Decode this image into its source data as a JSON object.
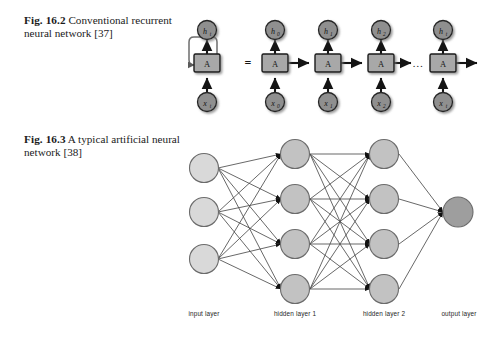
{
  "figures": [
    {
      "id": "fig-16-2",
      "caption_label": "Fig. 16.2",
      "caption_text": "Conventional recurrent neural network [37]",
      "equals_sign": "=",
      "ellipsis": "…",
      "folded_unit": {
        "cell_label": "A",
        "output_label": "h",
        "output_sub": "t",
        "input_label": "x",
        "input_sub": "t"
      },
      "unrolled_units": [
        {
          "cell_label": "A",
          "output_label": "h",
          "output_sub": "0",
          "input_label": "x",
          "input_sub": "0"
        },
        {
          "cell_label": "A",
          "output_label": "h",
          "output_sub": "1",
          "input_label": "x",
          "input_sub": "1"
        },
        {
          "cell_label": "A",
          "output_label": "h",
          "output_sub": "2",
          "input_label": "x",
          "input_sub": "2"
        },
        {
          "cell_label": "A",
          "output_label": "h",
          "output_sub": "t",
          "input_label": "x",
          "input_sub": "t"
        }
      ],
      "colors": {
        "cell_fill": "#a8a8a8",
        "cell_stroke": "#1a1a1a",
        "node_fill": "#8f8f8f",
        "node_stroke": "#262626",
        "arrow": "#141414",
        "loop_stroke": "#6e6e6e"
      }
    },
    {
      "id": "fig-16-3",
      "caption_label": "Fig. 16.3",
      "caption_text": "A typical artificial neural network [38]",
      "layers": [
        {
          "name": "input layer",
          "node_count": 3,
          "fill": "#d9d9d9"
        },
        {
          "name": "hidden layer 1",
          "node_count": 4,
          "fill": "#c2c2c2"
        },
        {
          "name": "hidden layer 2",
          "node_count": 4,
          "fill": "#c2c2c2"
        },
        {
          "name": "output layer",
          "node_count": 1,
          "fill": "#9e9e9e"
        }
      ],
      "colors": {
        "node_stroke": "#6b6b6b",
        "edge": "#4d4d4d",
        "arrowhead": "#111111",
        "label": "#262626"
      }
    }
  ]
}
